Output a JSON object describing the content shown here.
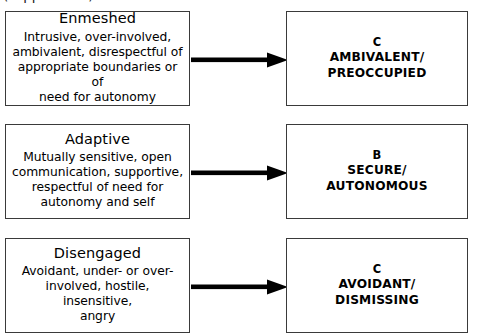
{
  "heading": {
    "text": "(clipped text)"
  },
  "diagram": {
    "type": "flowchart",
    "rows": [
      {
        "source": {
          "title": "Enmeshed",
          "description": "Intrusive, over-involved,\nambivalent, disrespectful of\nappropriate boundaries or of\nneed for autonomy"
        },
        "connector": "arrow-right",
        "target": {
          "code": "C",
          "label": "AMBIVALENT/\nPREOCCUPIED"
        }
      },
      {
        "source": {
          "title": "Adaptive",
          "description": "Mutually sensitive, open\ncommunication, supportive,\nrespectful of need for\nautonomy and self"
        },
        "connector": "arrow-right",
        "target": {
          "code": "B",
          "label": "SECURE/\nAUTONOMOUS"
        }
      },
      {
        "source": {
          "title": "Disengaged",
          "description": "Avoidant, under- or over-\ninvolved, hostile, insensitive,\nangry"
        },
        "connector": "arrow-right",
        "target": {
          "code": "C",
          "label": "AVOIDANT/\nDISMISSING"
        }
      }
    ]
  },
  "colors": {
    "box_border": "#3a3a3a",
    "arrow": "#000000",
    "text": "#000000",
    "background": "#ffffff"
  }
}
